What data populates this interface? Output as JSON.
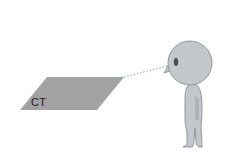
{
  "diagram": {
    "plane": {
      "label": "CT",
      "fill": "#a3a3a3",
      "points": [
        [
          20,
          110
        ],
        [
          47,
          77
        ],
        [
          124,
          77
        ],
        [
          97,
          110
        ]
      ]
    },
    "sight_line": {
      "from": [
        124,
        77
      ],
      "to": [
        167,
        66
      ],
      "color": "#86bdb6",
      "style": "dotted"
    },
    "figure": {
      "fill": "#c3c6cb",
      "stroke": "#8a8d92",
      "head": {
        "cx": 190,
        "cy": 63,
        "r": 22
      },
      "eye": {
        "cx": 176,
        "cy": 62,
        "rx": 2.2,
        "ry": 4,
        "color": "#4a4d52"
      }
    }
  }
}
